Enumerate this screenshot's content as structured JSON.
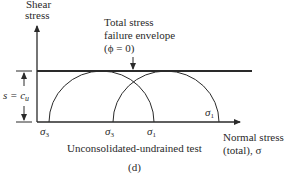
{
  "figure": {
    "y_axis_label_line1": "Shear",
    "y_axis_label_line2": "stress",
    "x_axis_label_line1": "Normal stress",
    "x_axis_label_line2": "(total), σ",
    "envelope_label_line1": "Total stress",
    "envelope_label_line2": "failure envelope",
    "envelope_label_line3": "(ϕ = 0)",
    "strength_label": "s = c",
    "strength_subscript": "u",
    "circle1_sigma3": "σ",
    "circle1_sigma3_sub": "3",
    "circle2_sigma3": "σ",
    "circle2_sigma3_sub": "3",
    "circle1_sigma1": "σ",
    "circle1_sigma1_sub": "1",
    "circle2_sigma1": "σ",
    "circle2_sigma1_sub": "1",
    "caption": "Unconsolidated-undrained test",
    "panel_label": "(d)"
  },
  "colors": {
    "line": "#2a2a2a",
    "background": "#ffffff"
  }
}
